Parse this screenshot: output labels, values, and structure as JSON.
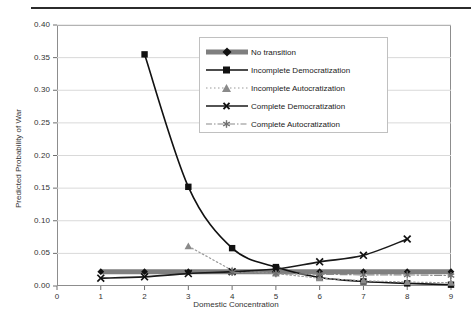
{
  "chart_data": {
    "type": "line",
    "title": "",
    "xlabel": "Domestic Concentration",
    "ylabel": "Predicted Probability of War",
    "xlim": [
      0,
      9
    ],
    "ylim": [
      0.0,
      0.4
    ],
    "yticks": [
      "0.00",
      "0.05",
      "0.10",
      "0.15",
      "0.20",
      "0.25",
      "0.30",
      "0.35",
      "0.40"
    ],
    "xticks": [
      "0",
      "1",
      "2",
      "3",
      "4",
      "5",
      "6",
      "7",
      "8",
      "9"
    ],
    "grid": "horizontal",
    "legend_position": "top-center-right",
    "x": [
      1,
      2,
      3,
      4,
      5,
      6,
      7,
      8,
      9
    ],
    "series": [
      {
        "name": "No transition",
        "marker": "diamond",
        "line": "solid-thick-gray",
        "color": "#7f7f7f",
        "marker_color": "#111111",
        "values": [
          0.022,
          0.022,
          0.022,
          0.022,
          0.022,
          0.022,
          0.022,
          0.022,
          0.022
        ]
      },
      {
        "name": "Incomplete Democratization",
        "marker": "square",
        "line": "solid",
        "color": "#111111",
        "marker_color": "#111111",
        "values": [
          null,
          0.355,
          0.152,
          0.058,
          0.029,
          0.013,
          0.007,
          0.004,
          0.002
        ]
      },
      {
        "name": "Incomplete Autocratization",
        "marker": "triangle",
        "line": "dotted",
        "color": "#9a9a9a",
        "marker_color": "#8a8a8a",
        "values": [
          null,
          null,
          0.061,
          0.024,
          0.019,
          0.012,
          0.008,
          0.006,
          0.005
        ]
      },
      {
        "name": "Complete Democratization",
        "marker": "x",
        "line": "solid",
        "color": "#1a1a1a",
        "marker_color": "#111111",
        "values": [
          0.012,
          0.014,
          0.019,
          0.022,
          0.026,
          0.037,
          0.047,
          0.072,
          null
        ]
      },
      {
        "name": "Complete Autocratization",
        "marker": "asterisk",
        "line": "dash-dot",
        "color": "#8a8a8a",
        "marker_color": "#707070",
        "values": [
          null,
          null,
          null,
          0.021,
          0.019,
          0.018,
          0.017,
          0.017,
          0.016
        ]
      }
    ]
  },
  "legend": {
    "items": [
      {
        "label": "No transition"
      },
      {
        "label": "Incomplete Democratization"
      },
      {
        "label": "Incomplete Autocratization"
      },
      {
        "label": "Complete Democratization"
      },
      {
        "label": "Complete Autocratization"
      }
    ]
  }
}
